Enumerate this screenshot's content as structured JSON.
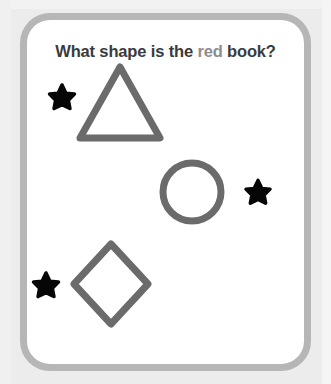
{
  "canvas": {
    "width": 331,
    "height": 384,
    "background_color": "#ececec"
  },
  "card": {
    "background_color": "#ffffff",
    "border_color": "#b6b6b6",
    "border_width_px": 7,
    "corner_radius_px": 30
  },
  "question": {
    "full_text": "What shape is the red book?",
    "text_before": "What shape is the ",
    "highlight_word": "red",
    "text_after": " book?",
    "base_color": "#3b3b3b",
    "highlight_color": "#8d8d8d"
  },
  "shapes": {
    "outline_color": "#6b6b6b",
    "stroke_width_px": 7,
    "items": [
      {
        "name": "triangle",
        "label": "triangle",
        "center_x": 140,
        "center_y": 118,
        "width": 84,
        "height": 76
      },
      {
        "name": "circle",
        "label": "circle",
        "center_x": 212,
        "center_y": 205,
        "radius": 29
      },
      {
        "name": "diamond",
        "label": "diamond",
        "center_x": 131,
        "center_y": 297,
        "half_width": 37,
        "half_height": 40
      }
    ]
  },
  "decorations": {
    "star_color": "#060606",
    "stars": [
      {
        "name": "star-top-left",
        "center_x": 82,
        "center_y": 111,
        "size": 30
      },
      {
        "name": "star-middle-right",
        "center_x": 278,
        "center_y": 206,
        "size": 29
      },
      {
        "name": "star-bottom-left",
        "center_x": 66,
        "center_y": 299,
        "size": 30
      }
    ]
  }
}
